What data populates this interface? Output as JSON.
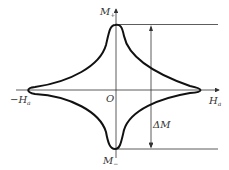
{
  "diagram": {
    "type": "magnetization-curve",
    "axes": {
      "vertical_label": "M",
      "vertical_sub": "+",
      "horizontal_label": "H",
      "horizontal_sub": "a",
      "negative_horizontal_label": "−H",
      "negative_horizontal_sub": "a",
      "origin_label": "O",
      "bottom_label": "M",
      "bottom_sub": "−"
    },
    "annotation": {
      "delta_label": "ΔM"
    },
    "colors": {
      "curve": "#111111",
      "axes": "#333333"
    }
  }
}
